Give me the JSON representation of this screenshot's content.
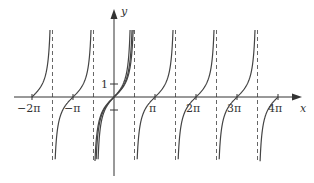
{
  "chart_data": {
    "type": "line",
    "title": "",
    "xlabel": "x",
    "ylabel": "y",
    "x_tick_labels": [
      "−2π",
      "−π",
      "π",
      "2π",
      "3π",
      "4π"
    ],
    "x_ticks": [
      -6.2832,
      -3.1416,
      3.1416,
      6.2832,
      9.4248,
      12.5664
    ],
    "y_tick_labels": [
      "1"
    ],
    "y_ticks": [
      1
    ],
    "xlim": [
      -7.9,
      15.4
    ],
    "ylim": [
      -5.0,
      5.2
    ],
    "grid": false,
    "legend": null,
    "asymptotes_x": [
      -4.7124,
      -1.5708,
      1.5708,
      4.7124,
      7.854,
      10.9956
    ],
    "asymptote_style": "dashed",
    "series": [
      {
        "name": "y = tan x",
        "function": "tan(x)",
        "period": 3.1416,
        "zeros": [
          -6.2832,
          -3.1416,
          0,
          3.1416,
          6.2832,
          9.4248,
          12.5664
        ]
      },
      {
        "name": "approximation near origin (inner)",
        "function": "tan-like curve through origin",
        "domain": [
          -1.5708,
          1.5708
        ]
      },
      {
        "name": "approximation near origin (outer)",
        "function": "tan-like curve through origin",
        "domain": [
          -1.5708,
          1.5708
        ]
      }
    ]
  },
  "axes": {
    "x_label": "x",
    "y_label": "y",
    "y_one_label": "1",
    "x_ticks": [
      {
        "label": "−2π"
      },
      {
        "label": "−π"
      },
      {
        "label": "π"
      },
      {
        "label": "2π"
      },
      {
        "label": "3π"
      },
      {
        "label": "4π"
      }
    ]
  },
  "colors": {
    "curve": "#444444",
    "axis": "#333333",
    "asymptote": "#666666"
  }
}
